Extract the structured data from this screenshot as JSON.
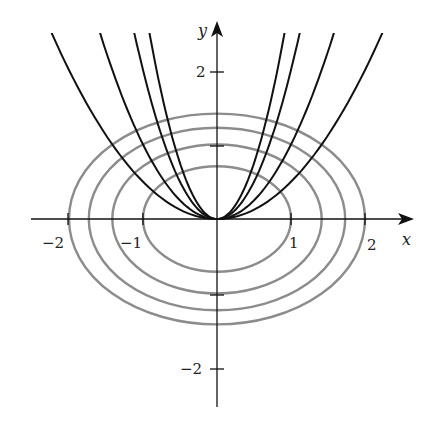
{
  "diagram": {
    "colors": {
      "ellipse": "#8c8c8c",
      "parabola": "#111111",
      "axis": "#111111",
      "background": "#ffffff"
    },
    "axes": {
      "x_label": "x",
      "y_label": "y",
      "x_ticks": [
        {
          "value": -2,
          "label": "−2"
        },
        {
          "value": -1,
          "label": "−1"
        },
        {
          "value": 1,
          "label": "1"
        },
        {
          "value": 2,
          "label": "2"
        }
      ],
      "y_ticks": [
        {
          "value": 2,
          "label": "2"
        },
        {
          "value": 1,
          "label": ""
        },
        {
          "value": -1,
          "label": ""
        },
        {
          "value": -2,
          "label": "−2"
        }
      ],
      "x_range": [
        -2.5,
        2.7
      ],
      "y_range": [
        -2.5,
        2.6
      ]
    },
    "ellipses": [
      {
        "equation": "x^2 + 2y^2 = 1",
        "c": 1
      },
      {
        "equation": "x^2 + 2y^2 = 2",
        "c": 2
      },
      {
        "equation": "x^2 + 2y^2 = 3",
        "c": 3
      },
      {
        "equation": "x^2 + 2y^2 = 4",
        "c": 4
      }
    ],
    "parabolas": [
      {
        "equation": "y = 0.5x^2",
        "k": 0.5
      },
      {
        "equation": "y = x^2",
        "k": 1
      },
      {
        "equation": "y = 2x^2",
        "k": 2
      },
      {
        "equation": "y = 3x^2",
        "k": 3
      }
    ],
    "labels": {
      "x_axis": "x",
      "y_axis": "y",
      "tick_x_neg2": "−2",
      "tick_x_neg1": "−1",
      "tick_x_1": "1",
      "tick_x_2": "2",
      "tick_y_2": "2",
      "tick_y_neg2": "−2"
    }
  }
}
